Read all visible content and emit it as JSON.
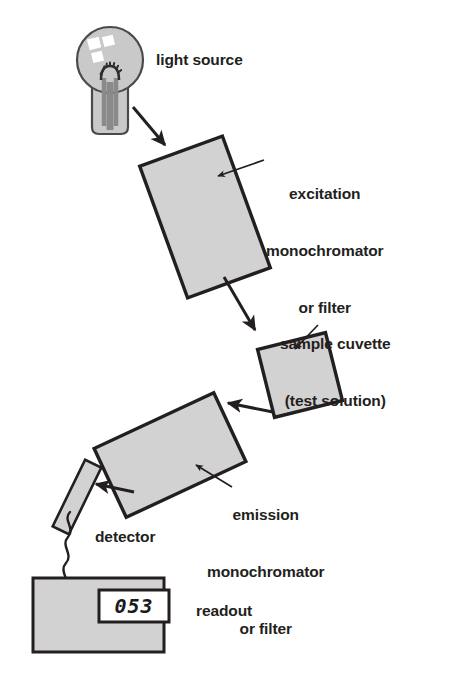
{
  "diagram": {
    "colors": {
      "component_fill": "#d2d2d2",
      "component_stroke": "#231f20",
      "bulb_fill": "#c9c9c9",
      "filament": "#8a8a8a",
      "highlight": "#ffffff",
      "text": "#231f20",
      "background": "#ffffff"
    },
    "labels": {
      "light_source": "light source",
      "excitation_line1": "excitation",
      "excitation_line2": "monochromator",
      "excitation_line3": "or filter",
      "cuvette_line1": "sample cuvette",
      "cuvette_line2": "(test solution)",
      "emission_line1": "emission",
      "emission_line2": "monochromator",
      "emission_line3": "or filter",
      "detector": "detector",
      "readout": "readout"
    },
    "readout_value": "053",
    "components": [
      {
        "name": "light-source-bulb",
        "label": "light source"
      },
      {
        "name": "excitation-monochromator-box",
        "label": "excitation monochromator or filter"
      },
      {
        "name": "sample-cuvette-box",
        "label": "sample cuvette (test solution)"
      },
      {
        "name": "emission-monochromator-box",
        "label": "emission monochromator or filter"
      },
      {
        "name": "detector-slab",
        "label": "detector"
      },
      {
        "name": "readout-box",
        "label": "readout"
      }
    ],
    "flow_arrows": [
      {
        "name": "arrow-source-to-excitation",
        "from": "light-source-bulb",
        "to": "excitation-monochromator-box"
      },
      {
        "name": "arrow-excitation-to-cuvette",
        "from": "excitation-monochromator-box",
        "to": "sample-cuvette-box"
      },
      {
        "name": "arrow-cuvette-to-emission",
        "from": "sample-cuvette-box",
        "to": "emission-monochromator-box"
      },
      {
        "name": "arrow-emission-to-detector",
        "from": "emission-monochromator-box",
        "to": "detector-slab"
      }
    ],
    "leader_lines": [
      {
        "name": "leader-excitation",
        "target": "excitation-monochromator-box"
      },
      {
        "name": "leader-cuvette",
        "target": "sample-cuvette-box"
      },
      {
        "name": "leader-emission",
        "target": "emission-monochromator-box"
      }
    ]
  }
}
